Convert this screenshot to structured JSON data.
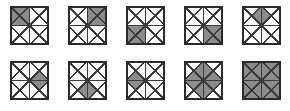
{
  "figure": {
    "rows": 2,
    "columns": 5,
    "tile_count": 10
  },
  "style": {
    "background_color": "#ffffff",
    "line_color": "#3a3a3a",
    "border_color": "#2b2b2b",
    "fill_color": "#8c8c8c",
    "unfilled_color": "#ffffff",
    "tile_size_px": 39,
    "grid_divisions": 2,
    "triangles_per_cell": 4
  },
  "tiles": [
    {
      "index": 1,
      "row": 0,
      "column": 0,
      "name": "tile-1",
      "shaded_description": "top-left cell fully shaded",
      "shaded_cells": [
        "top-left"
      ],
      "shaded_triangles": [
        "TL-N",
        "TL-E",
        "TL-S",
        "TL-W"
      ],
      "shaded_count": 4
    },
    {
      "index": 2,
      "row": 0,
      "column": 1,
      "name": "tile-2",
      "shaded_description": "top-right cell fully shaded",
      "shaded_cells": [
        "top-right"
      ],
      "shaded_triangles": [
        "TR-N",
        "TR-E",
        "TR-S",
        "TR-W"
      ],
      "shaded_count": 4
    },
    {
      "index": 3,
      "row": 0,
      "column": 2,
      "name": "tile-3",
      "shaded_description": "bottom-left cell fully shaded",
      "shaded_cells": [
        "bottom-left"
      ],
      "shaded_triangles": [
        "BL-N",
        "BL-E",
        "BL-S",
        "BL-W"
      ],
      "shaded_count": 4
    },
    {
      "index": 4,
      "row": 0,
      "column": 3,
      "name": "tile-4",
      "shaded_description": "bottom-right cell fully shaded",
      "shaded_cells": [
        "bottom-right"
      ],
      "shaded_triangles": [
        "BR-N",
        "BR-E",
        "BR-S",
        "BR-W"
      ],
      "shaded_count": 4
    },
    {
      "index": 5,
      "row": 0,
      "column": 4,
      "name": "tile-5",
      "shaded_description": "diamond straddling the top-centre edge",
      "shaded_cells": [],
      "shaded_triangles": [
        "TL-E",
        "TR-W"
      ],
      "shaded_count": 2
    },
    {
      "index": 6,
      "row": 1,
      "column": 0,
      "name": "tile-6",
      "shaded_description": "diamond straddling the centre-right edge",
      "shaded_cells": [],
      "shaded_triangles": [
        "TR-S",
        "BR-N"
      ],
      "shaded_count": 2
    },
    {
      "index": 7,
      "row": 1,
      "column": 1,
      "name": "tile-7",
      "shaded_description": "diamond straddling the bottom-centre edge",
      "shaded_cells": [],
      "shaded_triangles": [
        "BL-E",
        "BR-W"
      ],
      "shaded_count": 2
    },
    {
      "index": 8,
      "row": 1,
      "column": 2,
      "name": "tile-8",
      "shaded_description": "diamond straddling the centre-left edge",
      "shaded_cells": [],
      "shaded_triangles": [
        "TL-S",
        "BL-N"
      ],
      "shaded_count": 2
    },
    {
      "index": 9,
      "row": 1,
      "column": 3,
      "name": "tile-9",
      "shaded_description": "large central diamond from the four inner triangles",
      "shaded_cells": [],
      "shaded_triangles": [
        "TL-E",
        "TL-S",
        "TR-W",
        "TR-S",
        "BL-N",
        "BL-E",
        "BR-N",
        "BR-W"
      ],
      "shaded_count": 8
    },
    {
      "index": 10,
      "row": 1,
      "column": 4,
      "name": "tile-10",
      "shaded_description": "entire tile shaded",
      "shaded_cells": [
        "top-left",
        "top-right",
        "bottom-left",
        "bottom-right"
      ],
      "shaded_triangles": [
        "TL-N",
        "TL-E",
        "TL-S",
        "TL-W",
        "TR-N",
        "TR-E",
        "TR-S",
        "TR-W",
        "BL-N",
        "BL-E",
        "BL-S",
        "BL-W",
        "BR-N",
        "BR-E",
        "BR-S",
        "BR-W"
      ],
      "shaded_count": 16
    }
  ]
}
